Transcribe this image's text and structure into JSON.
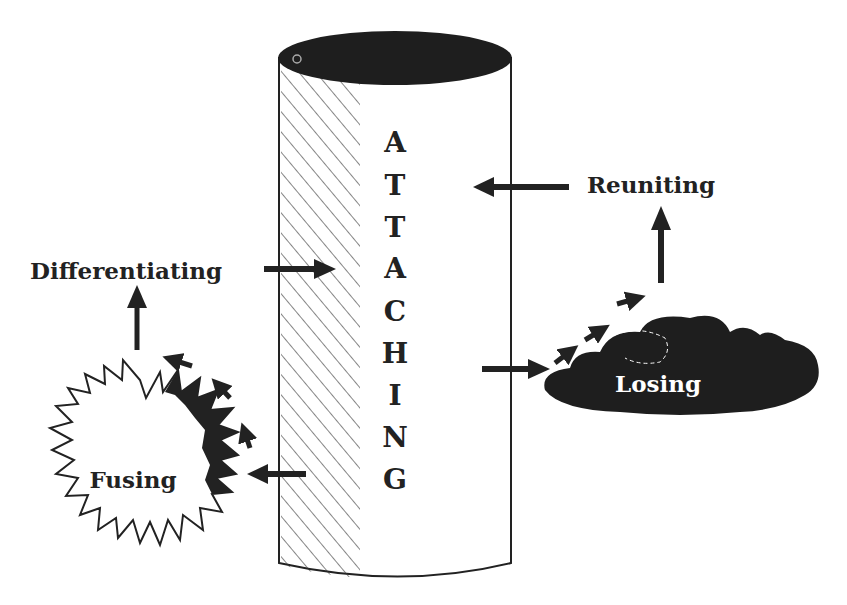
{
  "diagram": {
    "central_column": {
      "label_letters": [
        "A",
        "T",
        "T",
        "A",
        "C",
        "H",
        "I",
        "N",
        "G"
      ],
      "label_word": "ATTACHING"
    },
    "nodes": {
      "differentiating": "Differentiating",
      "reuniting": "Reuniting",
      "losing": "Losing",
      "fusing": "Fusing"
    },
    "colors": {
      "ink": "#222222",
      "background": "#ffffff",
      "cylinder_top": "#1e1e1e",
      "cloud": "#1e1e1e"
    },
    "flows": [
      {
        "from": "differentiating",
        "to": "attaching"
      },
      {
        "from": "reuniting",
        "to": "attaching"
      },
      {
        "from": "attaching",
        "to": "losing"
      },
      {
        "from": "losing",
        "to": "reuniting"
      },
      {
        "from": "attaching",
        "to": "fusing"
      },
      {
        "from": "fusing",
        "to": "differentiating"
      }
    ]
  }
}
